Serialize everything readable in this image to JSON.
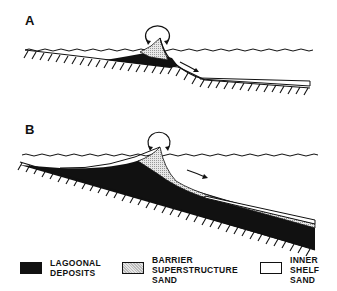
{
  "panels": [
    {
      "label": "A"
    },
    {
      "label": "B"
    }
  ],
  "legend": [
    {
      "key": "lagoonal",
      "lines": [
        "LAGOONAL",
        "DEPOSITS"
      ],
      "fill": "#111111"
    },
    {
      "key": "barrier",
      "lines": [
        "BARRIER",
        "SUPERSTRUCTURE",
        "SAND"
      ],
      "fill": "stippled-gray"
    },
    {
      "key": "shelf",
      "lines": [
        "INNER",
        "SHELF",
        "SAND"
      ],
      "fill": "#ffffff"
    }
  ],
  "colors": {
    "ink": "#111111",
    "stipple": "#c8c8c8",
    "background": "#ffffff"
  }
}
